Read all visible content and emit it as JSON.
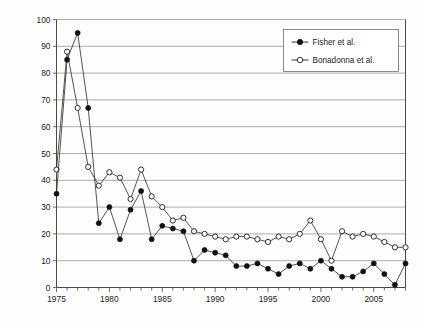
{
  "chart_data": {
    "type": "line",
    "title": "",
    "subtitle": "",
    "xlabel": "",
    "ylabel": "",
    "xlim": [
      1975,
      2008
    ],
    "ylim": [
      0,
      100
    ],
    "ytick_step": 10,
    "yticks": [
      0,
      10,
      20,
      30,
      40,
      50,
      60,
      70,
      80,
      90,
      100
    ],
    "xticks_major": [
      1975,
      1980,
      1985,
      1990,
      1995,
      2000,
      2005
    ],
    "xticks_minor_every": 1,
    "grid": "horizontal",
    "legend_position": "top-right",
    "x": [
      1975,
      1976,
      1977,
      1978,
      1979,
      1980,
      1981,
      1982,
      1983,
      1984,
      1985,
      1986,
      1987,
      1988,
      1989,
      1990,
      1991,
      1992,
      1993,
      1994,
      1995,
      1996,
      1997,
      1998,
      1999,
      2000,
      2001,
      2002,
      2003,
      2004,
      2005,
      2006,
      2007,
      2008
    ],
    "series": [
      {
        "name": "Fisher et al.",
        "marker": "filled-circle",
        "color": "#111111",
        "values": [
          35,
          85,
          95,
          67,
          24,
          30,
          18,
          29,
          36,
          18,
          23,
          22,
          21,
          10,
          14,
          13,
          12,
          8,
          8,
          9,
          7,
          5,
          8,
          9,
          7,
          10,
          7,
          4,
          4,
          6,
          9,
          5,
          1,
          9
        ]
      },
      {
        "name": "Bonadonna et al.",
        "marker": "open-circle",
        "color": "#1b1b1b",
        "values": [
          44,
          88,
          67,
          45,
          38,
          43,
          41,
          33,
          44,
          34,
          30,
          25,
          26,
          21,
          20,
          19,
          18,
          19,
          19,
          18,
          17,
          19,
          18,
          20,
          25,
          18,
          10,
          21,
          19,
          20,
          19,
          17,
          15,
          15
        ]
      }
    ],
    "legend": [
      {
        "label": "Fisher et al.",
        "marker": "filled-circle"
      },
      {
        "label": "Bonadonna et al.",
        "marker": "open-circle"
      }
    ]
  },
  "axes": {
    "y_tick_labels": [
      "0",
      "10",
      "20",
      "30",
      "40",
      "50",
      "60",
      "70",
      "80",
      "90",
      "100"
    ],
    "x_tick_labels": [
      "1975",
      "1980",
      "1985",
      "1990",
      "1995",
      "2000",
      "2005"
    ]
  }
}
